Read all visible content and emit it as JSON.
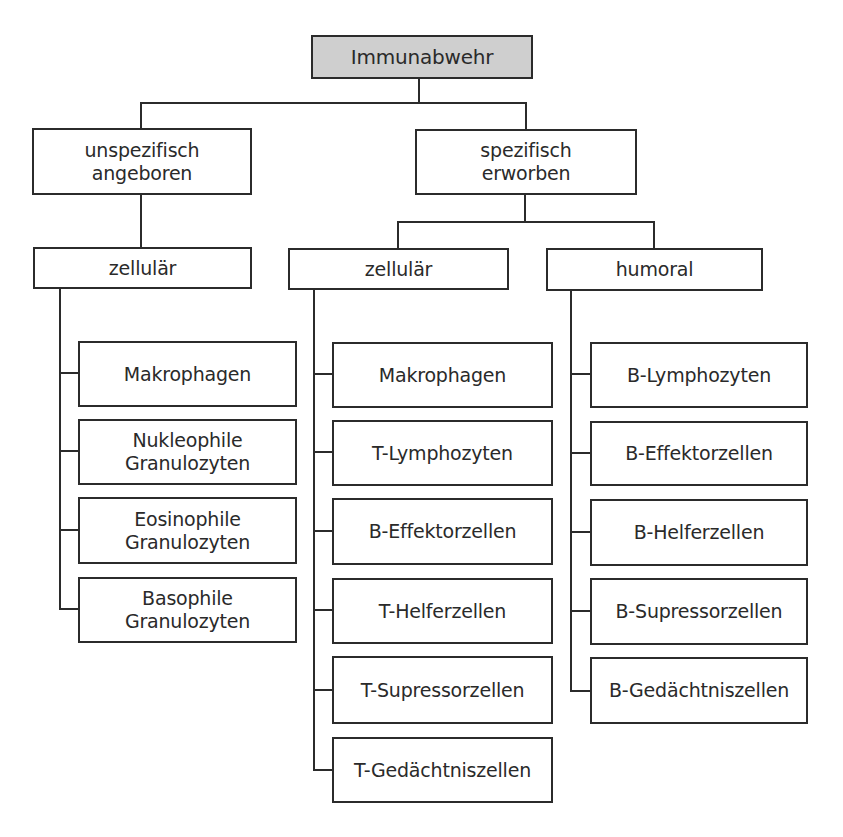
{
  "diagram": {
    "root": {
      "label": "Immunabwehr",
      "fill": "#cfcfcf"
    },
    "level1": [
      {
        "label": "unspezifisch\nangeboren"
      },
      {
        "label": "spezifisch\nerworben"
      }
    ],
    "level2": [
      {
        "label": "zellulär",
        "parent": "unspezifisch angeboren"
      },
      {
        "label": "zellulär",
        "parent": "spezifisch erworben"
      },
      {
        "label": "humoral",
        "parent": "spezifisch erworben"
      }
    ],
    "columns": [
      {
        "parent": "zellulär (unspezifisch)",
        "items": [
          "Makrophagen",
          "Nukleophile\nGranulozyten",
          "Eosinophile\nGranulozyten",
          "Basophile\nGranulozyten"
        ]
      },
      {
        "parent": "zellulär (spezifisch)",
        "items": [
          "Makrophagen",
          "T-Lymphozyten",
          "B-Effektorzellen",
          "T-Helferzellen",
          "T-Supressorzellen",
          "T-Gedächtniszellen"
        ]
      },
      {
        "parent": "humoral",
        "items": [
          "B-Lymphozyten",
          "B-Effektorzellen",
          "B-Helferzellen",
          "B-Supressorzellen",
          "B-Gedächtniszellen"
        ]
      }
    ]
  }
}
